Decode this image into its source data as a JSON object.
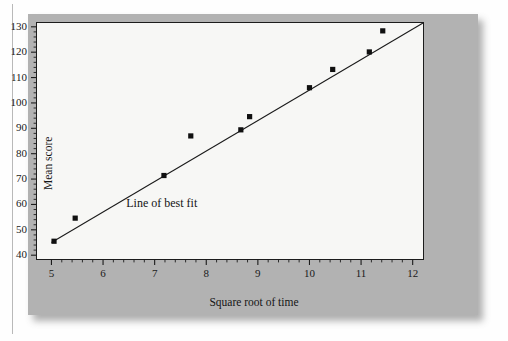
{
  "figure": {
    "background_color": "#b2b2b2",
    "plot_background_color": "#f7f7f5",
    "marker_color": "#101010",
    "line_color": "#1b1b1b"
  },
  "chart_data": {
    "type": "scatter",
    "title": "",
    "xlabel": "Square root of time",
    "ylabel": "Mean score",
    "xlim": [
      4.72,
      12.2
    ],
    "ylim": [
      38.5,
      131.5
    ],
    "xticks": [
      5,
      6,
      7,
      8,
      9,
      10,
      11,
      12
    ],
    "yticks": [
      40,
      50,
      60,
      70,
      80,
      90,
      100,
      110,
      120,
      130
    ],
    "xtick_labels": [
      "5",
      "6",
      "7",
      "8",
      "9",
      "10",
      "11",
      "12"
    ],
    "ytick_labels": [
      "40",
      "50",
      "60",
      "70",
      "80",
      "90",
      "100",
      "110",
      "120",
      "130"
    ],
    "minor_ticks_x": true,
    "minor_ticks_y": true,
    "grid": false,
    "legend": false,
    "x": [
      5.05,
      5.46,
      7.18,
      7.7,
      8.67,
      8.84,
      10.0,
      10.45,
      11.16,
      11.42
    ],
    "y": [
      45.5,
      54.6,
      71.4,
      87.0,
      89.4,
      94.6,
      106.0,
      113.2,
      120.1,
      128.4
    ],
    "points": [
      {
        "x": 5.05,
        "y": 45.5
      },
      {
        "x": 5.46,
        "y": 54.6
      },
      {
        "x": 7.18,
        "y": 71.4
      },
      {
        "x": 7.7,
        "y": 87.0
      },
      {
        "x": 8.67,
        "y": 89.4
      },
      {
        "x": 8.84,
        "y": 94.6
      },
      {
        "x": 10.0,
        "y": 106.0
      },
      {
        "x": 10.45,
        "y": 113.2
      },
      {
        "x": 11.16,
        "y": 120.1
      },
      {
        "x": 11.42,
        "y": 128.4
      }
    ],
    "fit_line": {
      "label": "Line of best fit",
      "x_start": 5.0,
      "y_start": 45.0,
      "x_end": 12.2,
      "y_end": 131.5
    },
    "annotations": [
      {
        "text": "Line of best fit",
        "x": 6.45,
        "y": 60.0
      }
    ]
  }
}
